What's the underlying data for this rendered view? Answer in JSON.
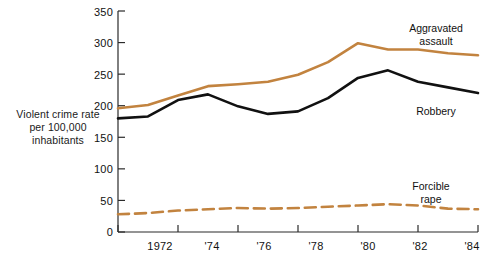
{
  "chart_data": {
    "type": "line",
    "title": "",
    "subtitle": "",
    "xlabel": "",
    "ylabel": "Violent crime rate per 100,000 inhabitants",
    "ylabel_lines": [
      "Violent crime rate",
      "per 100,000",
      "inhabitants"
    ],
    "xlim": [
      1972,
      1984
    ],
    "ylim": [
      0,
      350
    ],
    "y_ticks": [
      0,
      50,
      100,
      150,
      200,
      250,
      300,
      350
    ],
    "y_tick_labels": [
      "0",
      "50",
      "100",
      "150",
      "200",
      "250",
      "300",
      "350"
    ],
    "x_ticks": [
      1972,
      1974,
      1976,
      1978,
      1980,
      1982,
      1984
    ],
    "x_tick_labels": [
      "1972",
      "'74",
      "'76",
      "'78",
      "'80",
      "'82",
      "'84"
    ],
    "grid": false,
    "legend_position": "inline-annotations",
    "x": [
      1972,
      1973,
      1974,
      1975,
      1976,
      1977,
      1978,
      1979,
      1980,
      1981,
      1982,
      1983,
      1984
    ],
    "series": [
      {
        "name": "Aggravated assault",
        "color": "#C2833F",
        "style": "solid",
        "values": [
          196,
          201,
          216,
          231,
          234,
          238,
          249,
          269,
          299,
          289,
          289,
          283,
          280
        ]
      },
      {
        "name": "Robbery",
        "color": "#111111",
        "style": "solid",
        "values": [
          180,
          183,
          209,
          218,
          199,
          187,
          191,
          212,
          244,
          256,
          238,
          229,
          220
        ]
      },
      {
        "name": "Forcible rape",
        "color": "#C2833F",
        "style": "dashed",
        "values": [
          28,
          30,
          34,
          36,
          38,
          37,
          38,
          40,
          42,
          44,
          42,
          37,
          36
        ]
      }
    ],
    "annotations": [
      {
        "label": "Aggravated assault",
        "lines": [
          "Aggravated",
          "assault"
        ],
        "series": "Aggravated assault"
      },
      {
        "label": "Robbery",
        "lines": [
          "Robbery"
        ],
        "series": "Robbery"
      },
      {
        "label": "Forcible rape",
        "lines": [
          "Forcible",
          "rape"
        ],
        "series": "Forcible rape"
      }
    ]
  },
  "axis": {
    "y_label_line1": "Violent crime rate",
    "y_label_line2": "per 100,000",
    "y_label_line3": "inhabitants",
    "y_ticks": [
      "350",
      "300",
      "250",
      "200",
      "150",
      "100",
      "50",
      "0"
    ],
    "x_ticks": [
      "1972",
      "'74",
      "'76",
      "'78",
      "'80",
      "'82",
      "'84"
    ]
  },
  "labels": {
    "aggravated_line1": "Aggravated",
    "aggravated_line2": "assault",
    "robbery": "Robbery",
    "rape_line1": "Forcible",
    "rape_line2": "rape"
  },
  "colors": {
    "orange": "#C2833F",
    "black": "#111111",
    "axis": "#2b2b2b",
    "background": "#ffffff"
  }
}
